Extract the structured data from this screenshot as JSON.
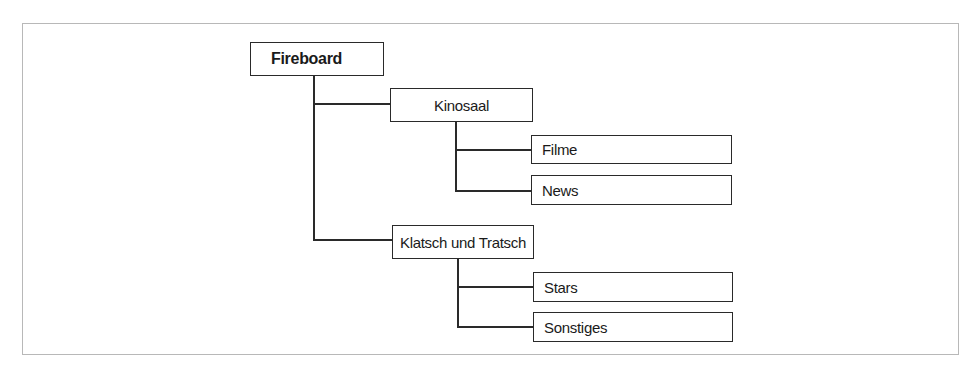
{
  "diagram": {
    "type": "tree",
    "root": {
      "label": "Fireboard",
      "children": [
        {
          "label": "Kinosaal",
          "children": [
            {
              "label": "Filme"
            },
            {
              "label": "News"
            }
          ]
        },
        {
          "label": "Klatsch und Tratsch",
          "children": [
            {
              "label": "Stars"
            },
            {
              "label": "Sonstiges"
            }
          ]
        }
      ]
    }
  },
  "colors": {
    "line": "#2a2a2a",
    "frame_border": "#b8b8b8",
    "background": "#ffffff"
  }
}
